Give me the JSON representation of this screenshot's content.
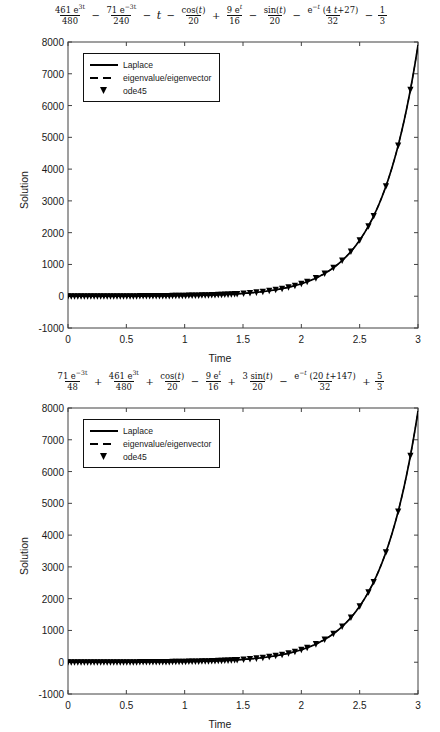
{
  "figures": [
    {
      "id": "figure-1",
      "title_plain": "461 e^{3t}/480 - 71 e^{-3t}/240 - t - cos(t)/20 + 9 e^{t}/16 - sin(t)/20 - e^{-t}(4t+27)/32 - 1/3",
      "title_terms": [
        {
          "op": "",
          "num": "461 e3t",
          "den": "480"
        },
        {
          "op": "−",
          "num": "71 e−3t",
          "den": "240"
        },
        {
          "op": "−",
          "plain": "t"
        },
        {
          "op": "−",
          "num": "cos(t)",
          "den": "20"
        },
        {
          "op": "+",
          "num": "9 et",
          "den": "16"
        },
        {
          "op": "−",
          "num": "sin(t)",
          "den": "20"
        },
        {
          "op": "−",
          "num": "e−t (4 t+27)",
          "den": "32"
        },
        {
          "op": "−",
          "num": "1",
          "den": "3"
        }
      ],
      "legend": {
        "items": [
          {
            "label": "Laplace",
            "style": "solid"
          },
          {
            "label": "eigenvalue/eigenvector",
            "style": "dashed"
          },
          {
            "label": "ode45",
            "style": "marker"
          }
        ]
      },
      "chart_data": {
        "type": "line",
        "title": "461 e^{3t}/480 - 71 e^{-3t}/240 - t - cos(t)/20 + 9 e^{t}/16 - sin(t)/20 - e^{-t}(4t+27)/32 - 1/3",
        "xlabel": "Time",
        "ylabel": "Solution",
        "xlim": [
          0,
          3
        ],
        "ylim": [
          -1000,
          8000
        ],
        "xticks": [
          0,
          0.5,
          1,
          1.5,
          2,
          2.5,
          3
        ],
        "xticklabels": [
          "0",
          "0.5",
          "1",
          "1.5",
          "2",
          "2.5",
          "3"
        ],
        "yticks": [
          -1000,
          0,
          1000,
          2000,
          3000,
          4000,
          5000,
          6000,
          7000,
          8000
        ],
        "yticklabels": [
          "-1000",
          "0",
          "1000",
          "2000",
          "3000",
          "4000",
          "5000",
          "6000",
          "7000",
          "8000"
        ],
        "grid": false,
        "legend_position": "upper left",
        "series": [
          {
            "name": "Laplace",
            "style": "solid",
            "x": [
              0,
              0.1,
              0.2,
              0.3,
              0.4,
              0.5,
              0.6,
              0.7,
              0.8,
              0.9,
              1,
              1.1,
              1.2,
              1.3,
              1.4,
              1.5,
              1.6,
              1.7,
              1.8,
              1.9,
              2,
              2.1,
              2.2,
              2.3,
              2.4,
              2.5,
              2.6,
              2.7,
              2.8,
              2.9,
              3
            ],
            "y": [
              0,
              0.6,
              3,
              8,
              18,
              34,
              60,
              100,
              160,
              248,
              375,
              556,
              813,
              1175,
              1683,
              2394,
              3390,
              4785,
              6734,
              9458,
              13265,
              18585,
              26019,
              36405,
              50915,
              71182,
              99488,
              139023,
              194200,
              271290,
              378900
            ]
          },
          {
            "name": "eigenvalue/eigenvector",
            "style": "dashed",
            "x": [
              0,
              0.1,
              0.2,
              0.3,
              0.4,
              0.5,
              0.6,
              0.7,
              0.8,
              0.9,
              1,
              1.1,
              1.2,
              1.3,
              1.4,
              1.5,
              1.6,
              1.7,
              1.8,
              1.9,
              2,
              2.1,
              2.2,
              2.3,
              2.4,
              2.5,
              2.6,
              2.7,
              2.8,
              2.9,
              3
            ],
            "y": [
              0,
              0.6,
              3,
              8,
              18,
              34,
              60,
              100,
              160,
              248,
              375,
              556,
              813,
              1175,
              1683,
              2394,
              3390,
              4785,
              6734,
              9458,
              13265,
              18585,
              26019,
              36405,
              50915,
              71182,
              99488,
              139023,
              194200,
              271290,
              378900
            ]
          },
          {
            "name": "ode45",
            "style": "marker",
            "marker": "diamond",
            "x": [
              0,
              0.1,
              0.2,
              0.3,
              0.4,
              0.5,
              0.6,
              0.7,
              0.8,
              0.9,
              1,
              1.1,
              1.2,
              1.3,
              1.4,
              1.5,
              1.6,
              1.7,
              1.8,
              1.9,
              2,
              2.1,
              2.2,
              2.3,
              2.4,
              2.5,
              2.6,
              2.7,
              2.8,
              2.9,
              3
            ],
            "y": [
              0,
              0.6,
              3,
              8,
              18,
              34,
              60,
              100,
              160,
              248,
              375,
              556,
              813,
              1175,
              1683,
              2394,
              3390,
              4785,
              6734,
              9458,
              13265,
              18585,
              26019,
              36405,
              50915,
              71182,
              99488,
              139023,
              194200,
              271290,
              378900
            ]
          }
        ],
        "note": "All three methods overlay exactly; visible curve is exponential growth reaching 7900 at t=3."
      }
    },
    {
      "id": "figure-2",
      "title_plain": "71 e^{-3t}/48 + 461 e^{3t}/480 + cos(t)/20 - 9 e^{t}/16 + 3 sin(t)/20 - e^{-t}(20t+147)/32 + 5/3",
      "title_terms": [
        {
          "op": "",
          "num": "71 e−3t",
          "den": "48"
        },
        {
          "op": "+",
          "num": "461 e3t",
          "den": "480"
        },
        {
          "op": "+",
          "num": "cos(t)",
          "den": "20"
        },
        {
          "op": "−",
          "num": "9 et",
          "den": "16"
        },
        {
          "op": "+",
          "num": "3 sin(t)",
          "den": "20"
        },
        {
          "op": "−",
          "num": "e−t (20 t+147)",
          "den": "32"
        },
        {
          "op": "+",
          "num": "5",
          "den": "3"
        }
      ],
      "legend": {
        "items": [
          {
            "label": "Laplace",
            "style": "solid"
          },
          {
            "label": "eigenvalue/eigenvector",
            "style": "dashed"
          },
          {
            "label": "ode45",
            "style": "marker"
          }
        ]
      },
      "chart_data": {
        "type": "line",
        "title": "71 e^{-3t}/48 + 461 e^{3t}/480 + cos(t)/20 - 9 e^{t}/16 + 3 sin(t)/20 - e^{-t}(20t+147)/32 + 5/3",
        "xlabel": "Time",
        "ylabel": "Solution",
        "xlim": [
          0,
          3
        ],
        "ylim": [
          -1000,
          8000
        ],
        "xticks": [
          0,
          0.5,
          1,
          1.5,
          2,
          2.5,
          3
        ],
        "xticklabels": [
          "0",
          "0.5",
          "1",
          "1.5",
          "2",
          "2.5",
          "3"
        ],
        "yticks": [
          -1000,
          0,
          1000,
          2000,
          3000,
          4000,
          5000,
          6000,
          7000,
          8000
        ],
        "yticklabels": [
          "-1000",
          "0",
          "1000",
          "2000",
          "3000",
          "4000",
          "5000",
          "6000",
          "7000",
          "8000"
        ],
        "grid": false,
        "legend_position": "upper left",
        "series": [
          {
            "name": "Laplace",
            "style": "solid",
            "x": [
              0,
              0.1,
              0.2,
              0.3,
              0.4,
              0.5,
              0.6,
              0.7,
              0.8,
              0.9,
              1,
              1.1,
              1.2,
              1.3,
              1.4,
              1.5,
              1.6,
              1.7,
              1.8,
              1.9,
              2,
              2.1,
              2.2,
              2.3,
              2.4,
              2.5,
              2.6,
              2.7,
              2.8,
              2.9,
              3
            ],
            "y": [
              0,
              0.6,
              3,
              8,
              18,
              34,
              60,
              100,
              160,
              248,
              375,
              556,
              813,
              1175,
              1683,
              2394,
              3390,
              4785,
              6734,
              9458,
              13265,
              18585,
              26019,
              36405,
              50915,
              71182,
              99488,
              139023,
              194200,
              271290,
              378900
            ]
          },
          {
            "name": "eigenvalue/eigenvector",
            "style": "dashed",
            "x": [
              0,
              0.1,
              0.2,
              0.3,
              0.4,
              0.5,
              0.6,
              0.7,
              0.8,
              0.9,
              1,
              1.1,
              1.2,
              1.3,
              1.4,
              1.5,
              1.6,
              1.7,
              1.8,
              1.9,
              2,
              2.1,
              2.2,
              2.3,
              2.4,
              2.5,
              2.6,
              2.7,
              2.8,
              2.9,
              3
            ],
            "y": [
              0,
              0.6,
              3,
              8,
              18,
              34,
              60,
              100,
              160,
              248,
              375,
              556,
              813,
              1175,
              1683,
              2394,
              3390,
              4785,
              6734,
              9458,
              13265,
              18585,
              26019,
              36405,
              50915,
              71182,
              99488,
              139023,
              194200,
              271290,
              378900
            ]
          },
          {
            "name": "ode45",
            "style": "marker",
            "marker": "diamond",
            "x": [
              0,
              0.1,
              0.2,
              0.3,
              0.4,
              0.5,
              0.6,
              0.7,
              0.8,
              0.9,
              1,
              1.1,
              1.2,
              1.3,
              1.4,
              1.5,
              1.6,
              1.7,
              1.8,
              1.9,
              2,
              2.1,
              2.2,
              2.3,
              2.4,
              2.5,
              2.6,
              2.7,
              2.8,
              2.9,
              3
            ],
            "y": [
              0,
              0.6,
              3,
              8,
              18,
              34,
              60,
              100,
              160,
              248,
              375,
              556,
              813,
              1175,
              1683,
              2394,
              3390,
              4785,
              6734,
              9458,
              13265,
              18585,
              26019,
              36405,
              50915,
              71182,
              99488,
              139023,
              194200,
              271290,
              378900
            ]
          }
        ],
        "note": "All three methods overlay exactly; visible curve is exponential growth reaching 7900 at t=3."
      }
    }
  ],
  "colors": {
    "line": "#000000",
    "axis": "#404040",
    "text": "#1a1a1a",
    "background": "#ffffff"
  }
}
